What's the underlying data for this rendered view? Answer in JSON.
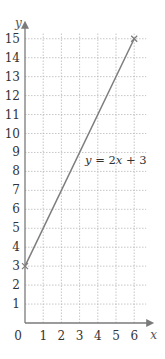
{
  "chart_data": {
    "type": "line",
    "title": "",
    "xlabel": "x",
    "ylabel": "y",
    "xlim": [
      0,
      6
    ],
    "ylim": [
      0,
      15
    ],
    "x_ticks": [
      1,
      2,
      3,
      4,
      5,
      6
    ],
    "y_ticks": [
      1,
      2,
      3,
      4,
      5,
      6,
      7,
      8,
      9,
      10,
      11,
      12,
      13,
      14,
      15
    ],
    "origin_label": "0",
    "grid": true,
    "legend": null,
    "series": [
      {
        "name": "y = 2x + 3",
        "x": [
          0,
          6
        ],
        "y": [
          3,
          15
        ],
        "markers": "x at endpoints"
      }
    ],
    "annotations": [
      {
        "text": "y = 2x + 3",
        "x": 3.3,
        "y": 8.4
      }
    ]
  }
}
